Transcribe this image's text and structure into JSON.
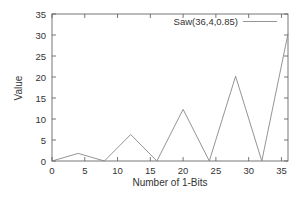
{
  "chart_data": {
    "type": "line",
    "title": "",
    "xlabel": "Number of 1-Bits",
    "ylabel": "Value",
    "xlim": [
      0,
      36
    ],
    "ylim": [
      0,
      35
    ],
    "xticks": [
      0,
      5,
      10,
      15,
      20,
      25,
      30,
      35
    ],
    "yticks": [
      0,
      5,
      10,
      15,
      20,
      25,
      30,
      35
    ],
    "grid": false,
    "legend_position": "top-right",
    "series": [
      {
        "name": "Saw(36,4,0.85)",
        "color": "#888888",
        "x": [
          0,
          4,
          8,
          12,
          16,
          20,
          24,
          28,
          32,
          36
        ],
        "y": [
          0,
          1.8,
          0,
          6.3,
          0,
          12.3,
          0,
          20.2,
          0,
          30.3
        ]
      }
    ]
  }
}
